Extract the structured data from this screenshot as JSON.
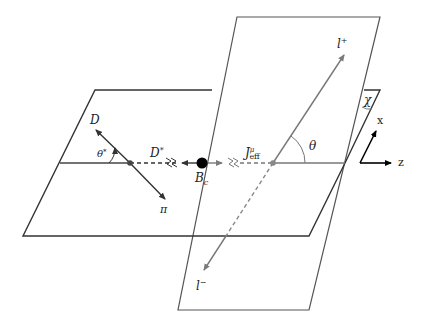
{
  "figure": {
    "colors": {
      "plane_edge": "#3a3a3a",
      "lepton_line": "#7a7a7a",
      "meson_line": "#333333",
      "node": "#000000",
      "background": "#ffffff"
    }
  },
  "labels": {
    "D": "D",
    "pi": "π",
    "theta_star": "θ*",
    "D_star": "D",
    "D_star_sup": "*",
    "Bc_main": "B",
    "Bc_sub": "c",
    "J_main": "J",
    "J_sup": "μ",
    "J_sub": "eff",
    "theta": "θ",
    "l_plus_main": "l",
    "l_plus_sup": "+",
    "l_minus_main": "l",
    "l_minus_sup": "−",
    "chi": "χ",
    "axis_x": "x",
    "axis_z": "z"
  }
}
